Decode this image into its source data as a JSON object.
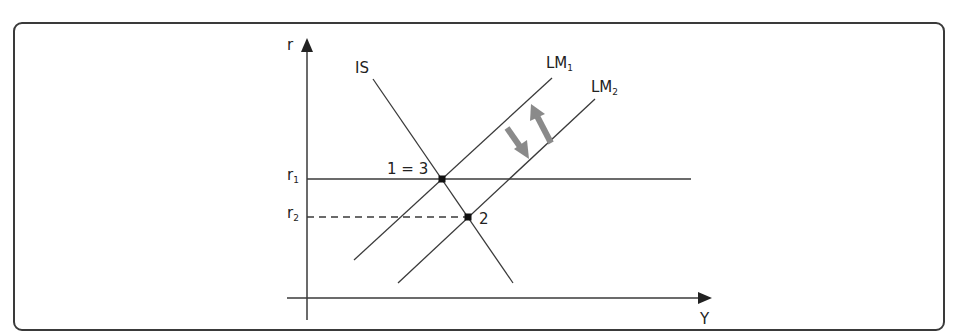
{
  "diagram": {
    "type": "IS-LM model",
    "axes": {
      "y_axis_label": "r",
      "x_axis_label": "Y"
    },
    "curves": [
      {
        "id": "IS",
        "label": "IS"
      },
      {
        "id": "LM1",
        "label": "LM",
        "subscript": "1"
      },
      {
        "id": "LM2",
        "label": "LM",
        "subscript": "2"
      }
    ],
    "interest_levels": [
      {
        "label": "r",
        "subscript": "1",
        "style": "solid"
      },
      {
        "label": "r",
        "subscript": "2",
        "style": "dashed"
      }
    ],
    "points": [
      {
        "label": "1 = 3",
        "at": "IS ∩ LM1 at r1"
      },
      {
        "label": "2",
        "at": "IS ∩ LM2 at r2"
      }
    ],
    "shift_arrows": [
      {
        "direction": "down-right",
        "meaning": "LM1 to LM2"
      },
      {
        "direction": "up-left",
        "meaning": "LM2 back to LM1"
      }
    ],
    "colors": {
      "line": "#3a3a3a",
      "arrow": "#8a8a8a",
      "frame": "#3a3a3a"
    }
  }
}
